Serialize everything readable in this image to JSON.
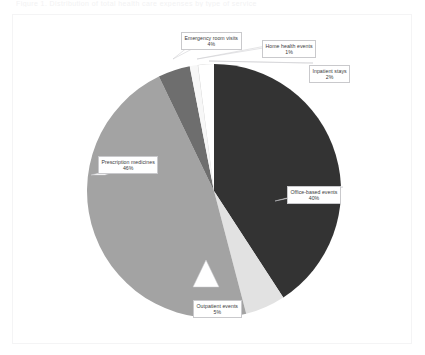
{
  "ghost_text": "Figure 1. Distribution of total health care expenses by type of service",
  "chart_data": {
    "type": "pie",
    "title": "",
    "legend_position": "callouts",
    "grid": false,
    "categories": [
      "Office-based events",
      "Outpatient events",
      "Prescription medicines",
      "Emergency room visits",
      "Home health events",
      "Inpatient stays"
    ],
    "values": [
      40,
      5,
      46,
      4,
      1,
      2
    ],
    "unit": "%",
    "colors": [
      "#333333",
      "#e2e2e2",
      "#a3a3a3",
      "#6e6e6e",
      "#f7f7f7",
      "#c2c2c2"
    ],
    "slices": [
      {
        "label": "Office-based events",
        "value": 40,
        "pct_text": "40%",
        "color": "#333333"
      },
      {
        "label": "Outpatient events",
        "value": 5,
        "pct_text": "5%",
        "color": "#e2e2e2"
      },
      {
        "label": "Prescription medicines",
        "value": 46,
        "pct_text": "46%",
        "color": "#a3a3a3"
      },
      {
        "label": "Emergency room visits",
        "value": 4,
        "pct_text": "4%",
        "color": "#6e6e6e"
      },
      {
        "label": "Home health events",
        "value": 1,
        "pct_text": "1%",
        "color": "#f7f7f7"
      },
      {
        "label": "Inpatient stays",
        "value": 2,
        "pct_text": "2%",
        "color": "#c2c2c2"
      }
    ]
  },
  "callouts": {
    "emergency": {
      "label": "Emergency room visits",
      "pct": "4%"
    },
    "homehealth": {
      "label": "Home health events",
      "pct": "1%"
    },
    "inpatient": {
      "label": "Inpatient stays",
      "pct": "2%"
    },
    "office": {
      "label": "Office-based events",
      "pct": "40%"
    },
    "rx": {
      "label": "Prescription medicines",
      "pct": "46%"
    },
    "outpatient": {
      "label": "Outpatient events",
      "pct": "5%"
    }
  }
}
